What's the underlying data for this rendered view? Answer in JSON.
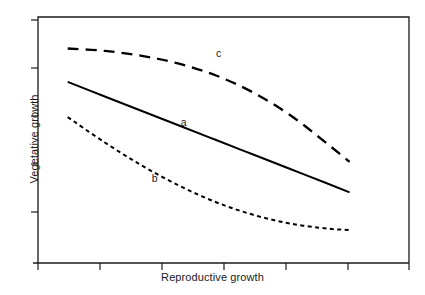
{
  "chart_data": {
    "type": "line",
    "title": "",
    "xlabel": "Reproductive growth",
    "ylabel": "Vegetative growth",
    "xlim": [
      0,
      100
    ],
    "ylim": [
      0,
      100
    ],
    "grid": false,
    "legend_position": "inline-annotations",
    "axis_tick_labels": {
      "x": [],
      "y": []
    },
    "x_tick_count": 6,
    "y_tick_count": 5,
    "annotations": [
      {
        "text": "a",
        "x": 39.3,
        "y": 57.0
      },
      {
        "text": "b",
        "x": 31.5,
        "y": 34.1
      },
      {
        "text": "c",
        "x": 48.8,
        "y": 85.0
      }
    ],
    "series": [
      {
        "name": "a",
        "label": "a",
        "style": "solid",
        "color": "#000000",
        "x": [
          8,
          18,
          28,
          38,
          48,
          58,
          68,
          78,
          84
        ],
        "y": [
          73.6,
          67.7,
          61.8,
          55.9,
          50.0,
          44.1,
          38.2,
          32.3,
          28.7
        ]
      },
      {
        "name": "b",
        "label": "b",
        "style": "dotted",
        "color": "#000000",
        "x": [
          8,
          18,
          28,
          38,
          48,
          58,
          68,
          78,
          84
        ],
        "y": [
          59.3,
          49.0,
          39.6,
          31.5,
          24.7,
          19.6,
          16.0,
          14.0,
          13.4
        ]
      },
      {
        "name": "c",
        "label": "c",
        "style": "dashed",
        "color": "#000000",
        "x": [
          8,
          18,
          28,
          38,
          48,
          58,
          68,
          78,
          84
        ],
        "y": [
          87.2,
          86.2,
          84.2,
          81.0,
          76.2,
          69.3,
          60.1,
          48.4,
          41.1
        ]
      }
    ]
  },
  "figure": {
    "background_color": "#ffffff",
    "line_color": "#000000",
    "axis_color": "#1a1a1a"
  }
}
